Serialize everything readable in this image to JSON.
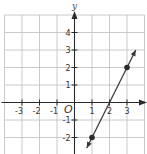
{
  "chart_data": {
    "type": "line",
    "title": "",
    "xlabel": "",
    "ylabel": "y",
    "origin_label": "O",
    "xlim": [
      -4,
      4
    ],
    "ylim": [
      -3,
      5
    ],
    "grid": true,
    "x_ticks": [
      -3,
      -2,
      -1,
      1,
      2,
      3
    ],
    "x_tick_labels": [
      "-3",
      "-2",
      "-1",
      "1",
      "2",
      "3"
    ],
    "y_ticks": [
      -2,
      -1,
      1,
      2,
      3,
      4
    ],
    "y_tick_labels": [
      "-2",
      "-1",
      "1",
      "2",
      "3",
      "4"
    ],
    "series": [
      {
        "name": "line",
        "equation": "y = 2x - 4",
        "slope": 2,
        "intercept": -4,
        "arrows_both_ends": true,
        "x_range": [
          0.7,
          3.5
        ],
        "color": "#3a3a3a"
      }
    ],
    "points": [
      {
        "x": 1,
        "y": -2
      },
      {
        "x": 3,
        "y": 2
      }
    ]
  },
  "colors": {
    "grid": "#bdbdbd",
    "axis": "#2a2a2a",
    "line": "#3a3a3a",
    "point": "#2a2a2a"
  }
}
